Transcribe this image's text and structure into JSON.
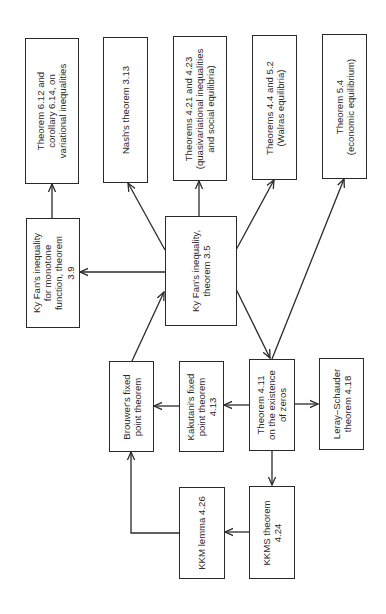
{
  "diagram": {
    "type": "flowchart",
    "orientation": "rotated-90-ccw",
    "nodes": {
      "thm612": {
        "lines": [
          "Theorem 6.12 and",
          "corollary 6.14, on",
          "variational inequalities"
        ]
      },
      "nash": {
        "lines": [
          "Nash's theorem 3.13"
        ]
      },
      "thm421": {
        "lines": [
          "Theorems 4.21 and 4.23",
          "(quasivariational inequalities",
          "and social equilibria)"
        ]
      },
      "walras": {
        "lines": [
          "Theorems 4.4 and 5.2",
          "(Walras equilibria)"
        ]
      },
      "thm54": {
        "lines": [
          "Theorem 5.4",
          "(economic equilibrium)"
        ]
      },
      "kyfan_mono": {
        "lines": [
          "Ky Fan's inequality",
          "for monotone",
          "function, theorem",
          "3.9"
        ]
      },
      "kyfan": {
        "lines": [
          "Ky Fan's inequality,",
          "theorem 3.5"
        ]
      },
      "brouwer": {
        "lines": [
          "Brouwer's fixed",
          "point theorem"
        ]
      },
      "kakutani": {
        "lines": [
          "Kakutani's fixed",
          "point theorem",
          "4.13"
        ]
      },
      "thm411": {
        "lines": [
          "Theorem 4.11",
          "on the existence",
          "of zeros"
        ]
      },
      "leray": {
        "lines": [
          "Leray–Schauder",
          "theorem 4.18"
        ]
      },
      "kkm": {
        "lines": [
          "KKM lemma 4.26"
        ]
      },
      "kkms": {
        "lines": [
          "KKMS theorem",
          "4.24"
        ]
      }
    },
    "edges": [
      {
        "from": "kkms",
        "to": "kkm"
      },
      {
        "from": "kkm",
        "to": "brouwer"
      },
      {
        "from": "brouwer",
        "to": "kyfan"
      },
      {
        "from": "kyfan",
        "to": "kyfan_mono"
      },
      {
        "from": "kyfan_mono",
        "to": "thm612"
      },
      {
        "from": "kyfan",
        "to": "nash"
      },
      {
        "from": "kyfan",
        "to": "thm421"
      },
      {
        "from": "kyfan",
        "to": "walras"
      },
      {
        "from": "kyfan",
        "to": "thm411"
      },
      {
        "from": "thm411",
        "to": "thm54"
      },
      {
        "from": "thm411",
        "to": "kakutani"
      },
      {
        "from": "kakutani",
        "to": "brouwer"
      },
      {
        "from": "thm411",
        "to": "leray"
      },
      {
        "from": "thm411",
        "to": "kkms"
      }
    ],
    "colors": {
      "ink": "#2a2a2a",
      "background": "#ffffff"
    }
  }
}
